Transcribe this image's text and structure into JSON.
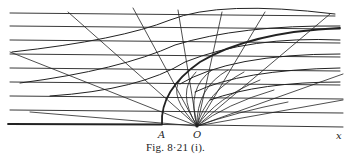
{
  "figure": {
    "caption": "Fig. 8·21 (i).",
    "labels": {
      "A": "A",
      "O": "O",
      "x": "x"
    },
    "colors": {
      "ink": "#222222",
      "background": "#ffffff"
    }
  },
  "diagram": {
    "origin_O": [
      197,
      126
    ],
    "point_A": [
      162,
      124
    ],
    "horizontal_lines_y": [
      13,
      26,
      40,
      54,
      68,
      82,
      96,
      110
    ],
    "baseline_y": 124,
    "ray_count": 10
  }
}
